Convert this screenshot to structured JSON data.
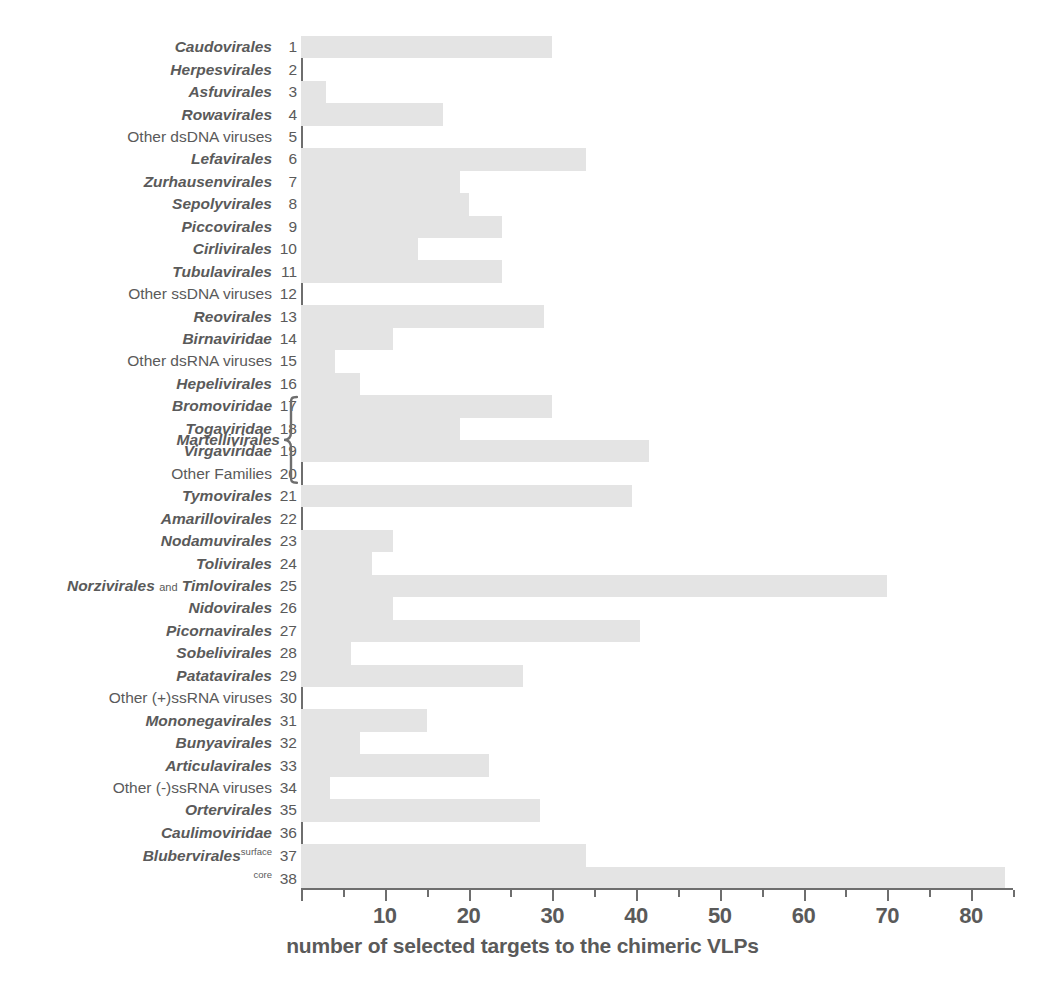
{
  "chart_data": {
    "type": "bar",
    "orientation": "horizontal",
    "title": "",
    "xlabel": "number of selected targets to the chimeric VLPs",
    "ylabel": "",
    "xlim": [
      0,
      85
    ],
    "xticks": [
      0,
      10,
      20,
      30,
      40,
      50,
      60,
      70,
      80
    ],
    "xticklabels": [
      "",
      "10",
      "20",
      "30",
      "40",
      "50",
      "60",
      "70",
      "80"
    ],
    "minor_tick_step": 5,
    "grid": false,
    "legend": null,
    "bar_color": "#e4e4e4",
    "axis_color": "#6e6e6e",
    "text_color": "#5a5a5a",
    "group_bracket": {
      "label": "Martellivirales",
      "covers_indices": [
        17,
        18,
        19,
        20
      ]
    },
    "categories": [
      {
        "index": "1",
        "name": "Caudovirales",
        "italic": true,
        "value": 30
      },
      {
        "index": "2",
        "name": "Herpesvirales",
        "italic": true,
        "value": 0
      },
      {
        "index": "3",
        "name": "Asfuvirales",
        "italic": true,
        "value": 3
      },
      {
        "index": "4",
        "name": "Rowavirales",
        "italic": true,
        "value": 17
      },
      {
        "index": "5",
        "name": "Other dsDNA viruses",
        "italic": false,
        "value": 0
      },
      {
        "index": "6",
        "name": "Lefavirales",
        "italic": true,
        "value": 34
      },
      {
        "index": "7",
        "name": "Zurhausenvirales",
        "italic": true,
        "value": 19
      },
      {
        "index": "8",
        "name": "Sepolyvirales",
        "italic": true,
        "value": 20
      },
      {
        "index": "9",
        "name": "Piccovirales",
        "italic": true,
        "value": 24
      },
      {
        "index": "10",
        "name": "Cirlivirales",
        "italic": true,
        "value": 14
      },
      {
        "index": "11",
        "name": "Tubulavirales",
        "italic": true,
        "value": 24
      },
      {
        "index": "12",
        "name": "Other ssDNA viruses",
        "italic": false,
        "value": 0
      },
      {
        "index": "13",
        "name": "Reovirales",
        "italic": true,
        "value": 29
      },
      {
        "index": "14",
        "name": "Birnaviridae",
        "italic": true,
        "value": 11
      },
      {
        "index": "15",
        "name": "Other dsRNA viruses",
        "italic": false,
        "value": 4
      },
      {
        "index": "16",
        "name": "Hepelivirales",
        "italic": true,
        "value": 7
      },
      {
        "index": "17",
        "name": "Bromoviridae",
        "italic": true,
        "value": 30
      },
      {
        "index": "18",
        "name": "Togaviridae",
        "italic": true,
        "value": 19
      },
      {
        "index": "19",
        "name": "Virgaviridae",
        "italic": true,
        "value": 41.5
      },
      {
        "index": "20",
        "name": "Other Families",
        "italic": false,
        "value": 0
      },
      {
        "index": "21",
        "name": "Tymovirales",
        "italic": true,
        "value": 39.5
      },
      {
        "index": "22",
        "name": "Amarillovirales",
        "italic": true,
        "value": 0
      },
      {
        "index": "23",
        "name": "Nodamuvirales",
        "italic": true,
        "value": 11
      },
      {
        "index": "24",
        "name": "Tolivirales",
        "italic": true,
        "value": 8.5
      },
      {
        "index": "25",
        "name": "Norzivirales and Timlovirales",
        "italic": true,
        "value": 70,
        "compound": true,
        "part_a": "Norzivirales",
        "joiner": "and",
        "part_b": "Timlovirales"
      },
      {
        "index": "26",
        "name": "Nidovirales",
        "italic": true,
        "value": 11
      },
      {
        "index": "27",
        "name": "Picornavirales",
        "italic": true,
        "value": 40.5
      },
      {
        "index": "28",
        "name": "Sobelivirales",
        "italic": true,
        "value": 6
      },
      {
        "index": "29",
        "name": "Patatavirales",
        "italic": true,
        "value": 26.5
      },
      {
        "index": "30",
        "name": "Other (+)ssRNA viruses",
        "italic": false,
        "value": 0
      },
      {
        "index": "31",
        "name": "Mononegavirales",
        "italic": true,
        "value": 15
      },
      {
        "index": "32",
        "name": "Bunyavirales",
        "italic": true,
        "value": 7
      },
      {
        "index": "33",
        "name": "Articulavirales",
        "italic": true,
        "value": 22.5
      },
      {
        "index": "34",
        "name": "Other (-)ssRNA viruses",
        "italic": false,
        "value": 3.5
      },
      {
        "index": "35",
        "name": "Ortervirales",
        "italic": true,
        "value": 28.5
      },
      {
        "index": "36",
        "name": "Caulimoviridae",
        "italic": true,
        "value": 0
      },
      {
        "index": "37",
        "name": "Blubervirales",
        "italic": true,
        "value": 34,
        "superscript": "surface"
      },
      {
        "index": "38",
        "name": "",
        "italic": true,
        "value": 84,
        "superscript": "core"
      }
    ]
  }
}
